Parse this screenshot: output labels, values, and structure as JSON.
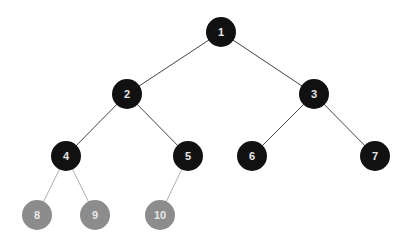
{
  "tree": {
    "colors": {
      "internal": "#111111",
      "leaf": "#8c8c8c",
      "label": "#e8e8e8"
    },
    "nodes": [
      {
        "id": "1",
        "label": "1",
        "x": 221,
        "y": 32,
        "type": "internal"
      },
      {
        "id": "2",
        "label": "2",
        "x": 127,
        "y": 94,
        "type": "internal"
      },
      {
        "id": "3",
        "label": "3",
        "x": 314,
        "y": 94,
        "type": "internal"
      },
      {
        "id": "4",
        "label": "4",
        "x": 66,
        "y": 156,
        "type": "internal"
      },
      {
        "id": "5",
        "label": "5",
        "x": 188,
        "y": 156,
        "type": "internal"
      },
      {
        "id": "6",
        "label": "6",
        "x": 252,
        "y": 156,
        "type": "internal"
      },
      {
        "id": "7",
        "label": "7",
        "x": 375,
        "y": 156,
        "type": "internal"
      },
      {
        "id": "8",
        "label": "8",
        "x": 37,
        "y": 215,
        "type": "leaf"
      },
      {
        "id": "9",
        "label": "9",
        "x": 95,
        "y": 215,
        "type": "leaf"
      },
      {
        "id": "10",
        "label": "10",
        "x": 160,
        "y": 215,
        "type": "leaf"
      }
    ],
    "edges": [
      [
        "1",
        "2"
      ],
      [
        "1",
        "3"
      ],
      [
        "2",
        "4"
      ],
      [
        "2",
        "5"
      ],
      [
        "3",
        "6"
      ],
      [
        "3",
        "7"
      ],
      [
        "4",
        "8"
      ],
      [
        "4",
        "9"
      ],
      [
        "5",
        "10"
      ]
    ]
  }
}
